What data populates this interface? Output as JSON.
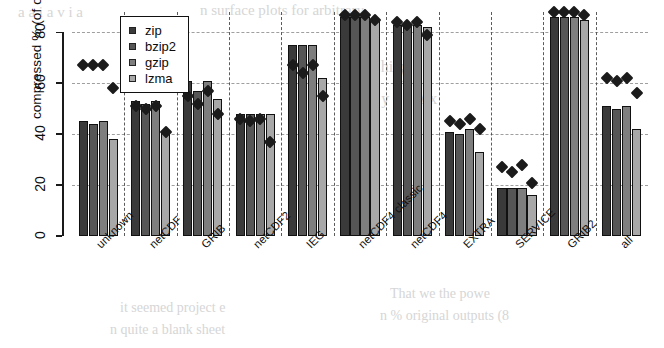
{
  "figure": {
    "title": "",
    "background_color": "#ffffff"
  },
  "legend": {
    "position": "top-left-inside",
    "entries": [
      {
        "label": "zip",
        "color": "#3a3a3a"
      },
      {
        "label": "bzip2",
        "color": "#565656"
      },
      {
        "label": "gzip",
        "color": "#7e7e7e"
      },
      {
        "label": "lzma",
        "color": "#a8a8a8"
      }
    ]
  },
  "axes": {
    "ylabel": "compressed % (of original)",
    "xlabel": "",
    "yticks": [
      "0",
      "20",
      "40",
      "60",
      "80"
    ],
    "ylim": [
      0,
      88
    ],
    "grid": "horizontal-dashed"
  },
  "page_bleed_text": [
    {
      "text": "n surface plots for arbitrary",
      "x": 200,
      "y": 2,
      "size": 15
    },
    {
      "text": "a a i a v i a",
      "x": 18,
      "y": 4,
      "size": 15
    },
    {
      "text": "y i",
      "x": 400,
      "y": 62,
      "size": 18
    },
    {
      "text": "Chi n",
      "x": 370,
      "y": 58,
      "size": 16
    },
    {
      "text": "s e   y c a   A x",
      "x": 360,
      "y": 90,
      "size": 16
    },
    {
      "text": "u",
      "x": 350,
      "y": 118,
      "size": 15
    },
    {
      "text": "it   seemed   project e",
      "x": 120,
      "y": 300,
      "size": 14
    },
    {
      "text": "n quite a blank sheet",
      "x": 110,
      "y": 322,
      "size": 14
    },
    {
      "text": "That  we  the  powe",
      "x": 390,
      "y": 286,
      "size": 14
    },
    {
      "text": "n  % original   outputs (8",
      "x": 380,
      "y": 308,
      "size": 14
    }
  ],
  "chart_data": {
    "type": "bar",
    "title": "",
    "xlabel": "",
    "ylabel": "compressed % (of original)",
    "ylim": [
      0,
      88
    ],
    "yticks": [
      0,
      20,
      40,
      60,
      80
    ],
    "grid": true,
    "legend_position": "upper left (inside axes)",
    "categories": [
      "unknown",
      "netCDF",
      "GRIB",
      "netCDF2",
      "IEG",
      "netCDF4 classic",
      "netCDF4",
      "EXTRA",
      "SERVICE",
      "GRIB2",
      "all"
    ],
    "series": [
      {
        "name": "zip",
        "color": "#3a3a3a",
        "values": [
          45,
          53,
          61,
          48,
          75,
          86,
          83,
          41,
          19,
          86,
          51
        ]
      },
      {
        "name": "bzip2",
        "color": "#565656",
        "values": [
          44,
          52,
          57,
          48,
          75,
          86,
          83,
          40,
          19,
          86,
          50
        ]
      },
      {
        "name": "gzip",
        "color": "#7e7e7e",
        "values": [
          45,
          53,
          61,
          48,
          75,
          86,
          83,
          42,
          19,
          86,
          51
        ]
      },
      {
        "name": "lzma",
        "color": "#a8a8a8",
        "values": [
          38,
          41,
          54,
          48,
          62,
          85,
          82,
          33,
          16,
          85,
          42
        ]
      }
    ],
    "overlay_markers": {
      "name": "per-file mean",
      "style": "filled diamond",
      "color": "#1b1b1b",
      "series": [
        {
          "name": "zip",
          "values": [
            67,
            51,
            55,
            46,
            67,
            87,
            84,
            45,
            27,
            88,
            62
          ]
        },
        {
          "name": "bzip2",
          "values": [
            67,
            50,
            52,
            45,
            64,
            87,
            83,
            44,
            25,
            88,
            61
          ]
        },
        {
          "name": "gzip",
          "values": [
            67,
            51,
            57,
            46,
            67,
            87,
            84,
            46,
            28,
            88,
            62
          ]
        },
        {
          "name": "lzma",
          "values": [
            58,
            41,
            48,
            37,
            55,
            85,
            79,
            42,
            21,
            87,
            56
          ]
        }
      ]
    }
  }
}
